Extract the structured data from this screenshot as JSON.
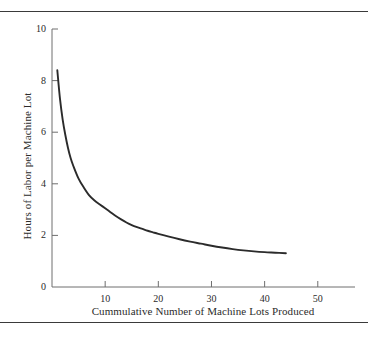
{
  "figure": {
    "background_color": "#ffffff",
    "rule_color": "#3a3a3a",
    "axis_color": "#6e6e6e",
    "curve_color": "#2b2b2b"
  },
  "chart_data": {
    "type": "line",
    "title": "",
    "subtitle": "",
    "xlabel": "Cummulative Number of Machine Lots Produced",
    "ylabel": "Hours of Labor per Machine Lot",
    "xlim": [
      0,
      57
    ],
    "ylim": [
      0,
      10
    ],
    "xticks": [
      10,
      20,
      30,
      40,
      50
    ],
    "yticks": [
      0,
      2,
      4,
      6,
      8,
      10
    ],
    "xtick_labels": [
      "10",
      "20",
      "30",
      "40",
      "50"
    ],
    "ytick_labels": [
      "0",
      "2",
      "4",
      "6",
      "8",
      "10"
    ],
    "grid": false,
    "legend": null,
    "annotations": [],
    "series": [
      {
        "name": "Learning curve",
        "x": [
          1,
          1.5,
          2,
          2.5,
          3,
          3.5,
          4,
          5,
          6,
          7,
          8,
          9,
          10,
          11,
          12,
          13,
          14,
          15,
          16,
          17,
          18,
          19,
          20,
          22,
          24,
          26,
          28,
          30,
          32,
          34,
          36,
          38,
          40,
          42,
          44
        ],
        "values": [
          8.4,
          7.3,
          6.5,
          5.9,
          5.4,
          5.0,
          4.7,
          4.2,
          3.85,
          3.55,
          3.35,
          3.2,
          3.05,
          2.9,
          2.75,
          2.62,
          2.5,
          2.4,
          2.32,
          2.25,
          2.18,
          2.12,
          2.06,
          1.95,
          1.85,
          1.76,
          1.68,
          1.6,
          1.53,
          1.47,
          1.42,
          1.38,
          1.35,
          1.33,
          1.31
        ]
      }
    ]
  }
}
